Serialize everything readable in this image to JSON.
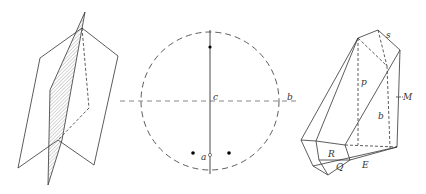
{
  "figures": [
    {
      "id": "twin-planes",
      "description": "Two intersecting planes, one hatched"
    },
    {
      "id": "stereogram",
      "labels": {
        "c": "c",
        "b": "b",
        "a": "a"
      }
    },
    {
      "id": "crystal",
      "labels": {
        "s": "s",
        "p": "p",
        "M": "M",
        "b": "b",
        "R": "R",
        "Q": "Q",
        "E": "E"
      }
    }
  ],
  "colors": {
    "line": "#333333",
    "hatch": "#bbbbbb",
    "background": "#ffffff"
  }
}
